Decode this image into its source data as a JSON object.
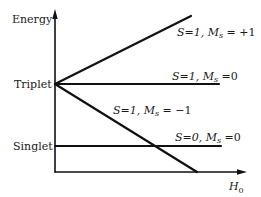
{
  "diagram": {
    "type": "energy-level-diagram",
    "y_axis_label": "Energy",
    "x_axis_label_base": "H",
    "x_axis_label_sub": "0",
    "levels": [
      {
        "name": "Triplet",
        "label": "Triplet"
      },
      {
        "name": "Singlet",
        "label": "Singlet"
      }
    ],
    "states": [
      {
        "id": "t_plus",
        "S": "S=1,",
        "M": "M",
        "Msub": "s",
        "value": " = +1",
        "trend": "increasing"
      },
      {
        "id": "t_zero",
        "S": "S=1,",
        "M": "M",
        "Msub": "s",
        "value": " =0",
        "trend": "flat"
      },
      {
        "id": "t_minus",
        "S": "S=1,",
        "M": "M",
        "Msub": "s",
        "value": " = −1",
        "trend": "decreasing"
      },
      {
        "id": "singlet",
        "S": "S=0,",
        "M": "M",
        "Msub": "s",
        "value": " =0",
        "trend": "flat"
      }
    ],
    "colors": {
      "line": "#111111",
      "text": "#1a1a1a",
      "background": "#ffffff"
    }
  }
}
